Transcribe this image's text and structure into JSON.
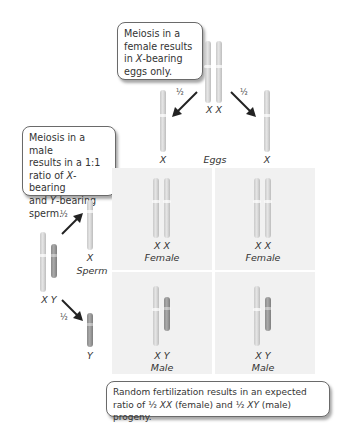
{
  "callouts": {
    "female": {
      "line1": "Meiosis in a",
      "line2": "female results",
      "line3_pre": "in ",
      "line3_em": "X",
      "line3_post": "-bearing",
      "line4": "eggs only."
    },
    "male": {
      "line1": "Meiosis in a male",
      "line2": "results in a 1:1",
      "line3_pre": "ratio of ",
      "line3_em": "X",
      "line3_post": "-bearing",
      "line4_pre": "and ",
      "line4_em": "Y",
      "line4_post": "-bearing",
      "line5": "sperm."
    },
    "fertilization": {
      "line1": "Random fertilization results in an expected",
      "line2_a": "ratio of ½ ",
      "line2_b": "XX",
      "line2_c": " (female) and ½ ",
      "line2_d": "XY",
      "line2_e": " (male) progeny."
    }
  },
  "female_parent": {
    "genotype": "X X"
  },
  "male_parent": {
    "genotype": "X Y"
  },
  "eggs": {
    "label": "Eggs",
    "left": "X",
    "right": "X",
    "prob_left": "½",
    "prob_right": "½"
  },
  "sperm": {
    "label": "Sperm",
    "top": "X",
    "bottom": "Y",
    "prob_top": "½",
    "prob_bottom": "½"
  },
  "punnett": [
    {
      "genotype": "X X",
      "sex": "Female"
    },
    {
      "genotype": "X X",
      "sex": "Female"
    },
    {
      "genotype": "X Y",
      "sex": "Male"
    },
    {
      "genotype": "X Y",
      "sex": "Male"
    }
  ],
  "colors": {
    "x_chromosome": "#d6d6d6",
    "y_chromosome": "#8f8f8f",
    "cell_bg": "#f1f1f1",
    "arrow": "#222222"
  }
}
